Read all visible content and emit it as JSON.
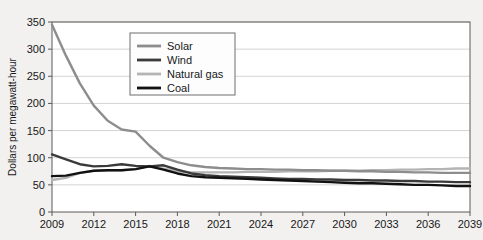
{
  "chart_data": {
    "type": "line",
    "title": "",
    "xlabel": "",
    "ylabel": "Dollars per megawatt-hour",
    "xlim": [
      2009,
      2039
    ],
    "ylim": [
      0,
      350
    ],
    "grid": true,
    "legend_position": "upper-center-left",
    "x": [
      2009,
      2010,
      2011,
      2012,
      2013,
      2014,
      2015,
      2016,
      2017,
      2018,
      2019,
      2020,
      2021,
      2022,
      2023,
      2024,
      2025,
      2026,
      2027,
      2028,
      2029,
      2030,
      2031,
      2032,
      2033,
      2034,
      2035,
      2036,
      2037,
      2038,
      2039
    ],
    "xticks": [
      2009,
      2012,
      2015,
      2018,
      2021,
      2024,
      2027,
      2030,
      2033,
      2036,
      2039
    ],
    "xtick_labels": [
      "2009",
      "2012",
      "2015",
      "2018",
      "2021",
      "2024",
      "2027",
      "2030",
      "2033",
      "2036",
      "2039"
    ],
    "yticks": [
      0,
      50,
      100,
      150,
      200,
      250,
      300,
      350
    ],
    "ytick_labels": [
      "0",
      "50",
      "100",
      "150",
      "200",
      "250",
      "300",
      "350"
    ],
    "series": [
      {
        "name": "Solar",
        "color": "#8d8d8d",
        "values": [
          345,
          288,
          237,
          196,
          168,
          152,
          148,
          122,
          100,
          92,
          86,
          83,
          81,
          80,
          79,
          79,
          78,
          78,
          77,
          77,
          76,
          76,
          75,
          75,
          74,
          74,
          73,
          73,
          72,
          72,
          72
        ]
      },
      {
        "name": "Wind",
        "color": "#3a3a3a",
        "values": [
          106,
          97,
          88,
          84,
          85,
          88,
          85,
          84,
          86,
          78,
          71,
          68,
          66,
          65,
          64,
          63,
          62,
          61,
          61,
          60,
          60,
          59,
          59,
          58,
          58,
          57,
          57,
          56,
          56,
          55,
          55
        ]
      },
      {
        "name": "Natural gas",
        "color": "#b4b4b4",
        "values": [
          59,
          63,
          72,
          76,
          77,
          77,
          79,
          85,
          80,
          75,
          73,
          73,
          73,
          73,
          74,
          74,
          74,
          75,
          75,
          75,
          76,
          76,
          76,
          77,
          77,
          78,
          78,
          79,
          79,
          80,
          80
        ]
      },
      {
        "name": "Coal",
        "color": "#111111",
        "values": [
          66,
          67,
          72,
          76,
          77,
          77,
          79,
          84,
          78,
          71,
          66,
          64,
          63,
          62,
          61,
          60,
          59,
          58,
          57,
          56,
          55,
          54,
          53,
          53,
          52,
          51,
          50,
          50,
          49,
          48,
          48
        ]
      }
    ],
    "legend_entries": [
      {
        "label": "Solar",
        "color": "#8d8d8d"
      },
      {
        "label": "Wind",
        "color": "#3a3a3a"
      },
      {
        "label": "Natural gas",
        "color": "#b4b4b4"
      },
      {
        "label": "Coal",
        "color": "#111111"
      }
    ]
  },
  "style": {
    "background": "#f2f1ef",
    "plot_background": "#ffffff",
    "axis_color": "#5a5a5a",
    "grid_color": "#c9c9c9",
    "text_color": "#17181a",
    "legend_border": "#6e6e6e",
    "legend_background": "#fdfdfd"
  }
}
